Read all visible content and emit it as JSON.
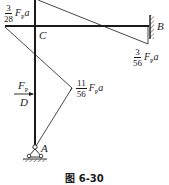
{
  "figure": {
    "caption": "图 6-30",
    "type": "bending-moment-diagram-rigid-frame"
  },
  "nodes": {
    "A": "A",
    "B": "B",
    "C": "C",
    "D": "D"
  },
  "load": {
    "label": "F",
    "subscript": "P"
  },
  "moments": [
    {
      "id": "top-left",
      "numerator": "3",
      "denominator": "28",
      "symbol": "F",
      "subscript": "P",
      "suffix": "a"
    },
    {
      "id": "at-B",
      "numerator": "3",
      "denominator": "56",
      "symbol": "F",
      "subscript": "P",
      "suffix": "a"
    },
    {
      "id": "at-D",
      "numerator": "11",
      "denominator": "56",
      "symbol": "F",
      "subscript": "P",
      "suffix": "a"
    }
  ],
  "colors": {
    "line": "#1a1a1a",
    "background": "#ffffff"
  }
}
